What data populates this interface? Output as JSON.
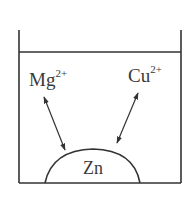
{
  "diagram": {
    "type": "beaker-with-ions",
    "colors": {
      "stroke": "#333333",
      "text": "#3a3a3a",
      "background": "#ffffff"
    },
    "ions": [
      {
        "symbol": "Mg",
        "charge": "2+"
      },
      {
        "symbol": "Cu",
        "charge": "2+"
      }
    ],
    "metal": {
      "label": "Zn"
    },
    "arrows": [
      {
        "from": "Mg2+",
        "to": "Zn",
        "style": "double-headed"
      },
      {
        "from": "Cu2+",
        "to": "Zn",
        "style": "double-headed"
      }
    ]
  }
}
